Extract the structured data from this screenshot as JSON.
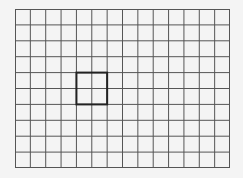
{
  "diagram": {
    "type": "grid",
    "columns": 14,
    "rows": 10,
    "line_color": "#555555",
    "background": "#f4f4f4",
    "highlight": {
      "col": 4,
      "row": 4,
      "width_cells": 2,
      "height_cells": 2,
      "color": "#222222"
    }
  }
}
